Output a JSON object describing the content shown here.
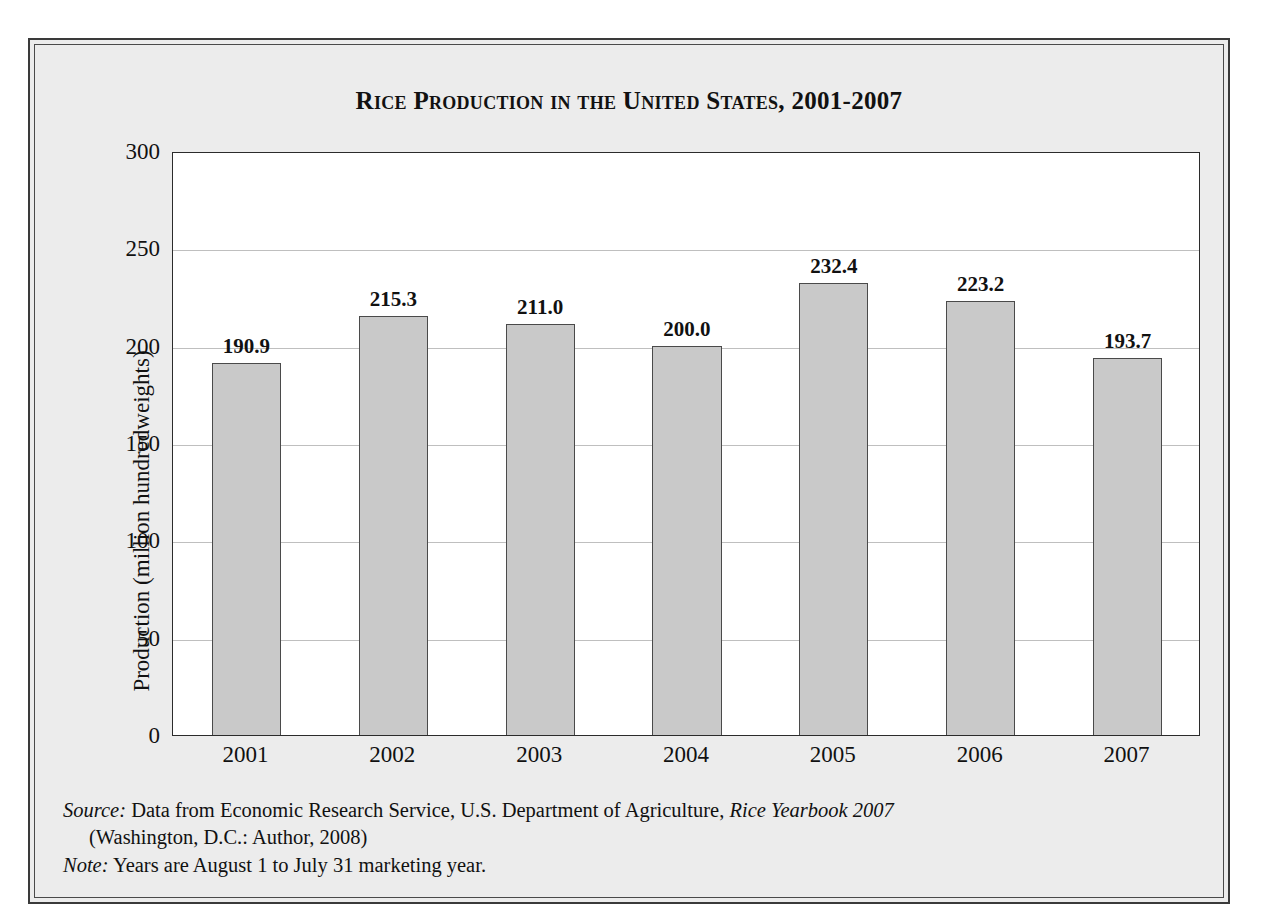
{
  "chart_data": {
    "type": "bar",
    "title": "Rice Production in the United States, 2001-2007",
    "xlabel": "",
    "ylabel": "Production (million hundredweights)",
    "categories": [
      "2001",
      "2002",
      "2003",
      "2004",
      "2005",
      "2006",
      "2007"
    ],
    "values": [
      190.9,
      215.3,
      211.0,
      200.0,
      232.4,
      223.2,
      193.7
    ],
    "value_labels": [
      "190.9",
      "215.3",
      "211.0",
      "200.0",
      "232.4",
      "223.2",
      "193.7"
    ],
    "ylim": [
      0,
      300
    ],
    "yticks": [
      0,
      50,
      100,
      150,
      200,
      250,
      300
    ],
    "ytick_labels": [
      "0",
      "50",
      "100",
      "150",
      "200",
      "250",
      "300"
    ],
    "grid": "horizontal",
    "legend": "none",
    "bar_color": "#c9c9c9",
    "bar_edge_color": "#4a4a4a",
    "plot_background": "#ffffff",
    "figure_background": "#ececec",
    "gridline_color": "#bfbfbf",
    "text_color": "#111111"
  },
  "notes": {
    "source_label": "Source:",
    "source_text_1": " Data from Economic Research Service, U.S. Department of Agriculture, ",
    "source_italic_title": "Rice Yearbook 2007",
    "source_line_2": "(Washington, D.C.: Author, 2008)",
    "note_label": "Note:",
    "note_text": " Years are August 1 to July 31 marketing year."
  }
}
